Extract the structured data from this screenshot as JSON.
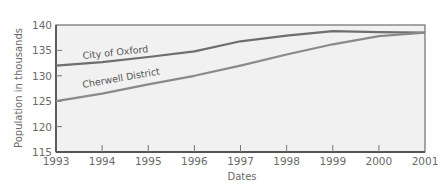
{
  "chart_data": {
    "type": "line",
    "title": "",
    "xlabel": "Dates",
    "ylabel": "Population in thousands",
    "x": [
      1993,
      1994,
      1995,
      1996,
      1997,
      1998,
      1999,
      2000,
      2001
    ],
    "x_tick_labels": [
      "1993",
      "1994",
      "1995",
      "1996",
      "1997",
      "1998",
      "1999",
      "2000",
      "2001"
    ],
    "y_tick_labels": [
      "115",
      "120",
      "125",
      "130",
      "135",
      "140"
    ],
    "ylim": [
      115,
      140
    ],
    "xlim": [
      1993,
      2001
    ],
    "grid": false,
    "legend": "inline labels on lines",
    "series": [
      {
        "name": "City of Oxford",
        "values": [
          132,
          132.7,
          133.7,
          134.8,
          136.8,
          137.9,
          138.8,
          138.6,
          138.5
        ],
        "color": "#6e6e6e"
      },
      {
        "name": "Cherwell District",
        "values": [
          125,
          126.5,
          128.3,
          130,
          132,
          134.2,
          136.2,
          137.8,
          138.5
        ],
        "color": "#8a8a8a"
      }
    ]
  },
  "colors": {
    "plot_background": "#f1f1f1",
    "axis": "#6e6e6e",
    "text": "#6a6a6a"
  }
}
